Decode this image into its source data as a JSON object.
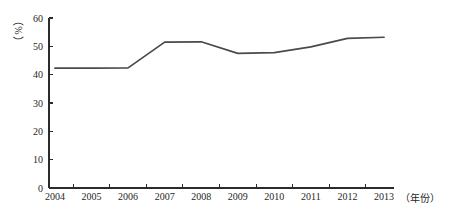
{
  "chart_data": {
    "type": "line",
    "title": "",
    "subtitle": "",
    "xlabel": "（年份）",
    "ylabel": "（%）",
    "categories": [
      "2004",
      "2005",
      "2006",
      "2007",
      "2008",
      "2009",
      "2010",
      "2011",
      "2012",
      "2013"
    ],
    "values": [
      42.3,
      42.3,
      42.4,
      51.5,
      51.6,
      47.5,
      47.8,
      49.8,
      52.8,
      53.2
    ],
    "series": [
      {
        "name": "",
        "values": [
          42.3,
          42.3,
          42.4,
          51.5,
          51.6,
          47.5,
          47.8,
          49.8,
          52.8,
          53.2
        ]
      }
    ],
    "ylim": [
      0,
      60
    ],
    "yticks": [
      "0",
      "10",
      "20",
      "30",
      "40",
      "50",
      "60"
    ],
    "ytick_values": [
      0,
      10,
      20,
      30,
      40,
      50,
      60
    ],
    "grid": false,
    "legend": false,
    "legend_position": "none",
    "line_color": "#4a4a4a",
    "axis_color": "#2b2b2b",
    "background_color": "#ffffff"
  },
  "labels": {
    "y_axis_caption_open": "（",
    "y_axis_caption_symbol": "%",
    "y_axis_caption_close": "）",
    "x_axis_caption": "（年份）"
  }
}
